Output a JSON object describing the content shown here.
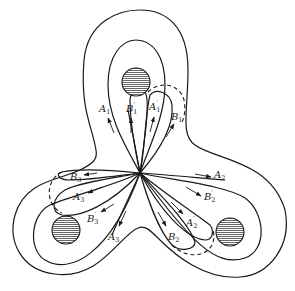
{
  "figure": {
    "colors": {
      "ink": "#1a1a1a",
      "hatch_fill": "#9a9a9a",
      "background": "#ffffff"
    },
    "center": [
      140,
      173
    ],
    "obstacles": [
      {
        "name": "top",
        "cx": 136,
        "cy": 82,
        "r": 14
      },
      {
        "name": "left",
        "cx": 66,
        "cy": 230,
        "r": 14
      },
      {
        "name": "right",
        "cx": 230,
        "cy": 232,
        "r": 14
      }
    ],
    "labels": [
      {
        "id": "A1",
        "base": "A",
        "sub": "1",
        "prime": "",
        "x": 99,
        "y": 112
      },
      {
        "id": "B1p",
        "base": "B",
        "sub": "1",
        "prime": "′",
        "x": 126,
        "y": 112
      },
      {
        "id": "A1p",
        "base": "A",
        "sub": "1",
        "prime": "′",
        "x": 149,
        "y": 110
      },
      {
        "id": "B1",
        "base": "B",
        "sub": "1",
        "prime": "",
        "x": 171,
        "y": 120
      },
      {
        "id": "A2",
        "base": "A",
        "sub": "2",
        "prime": "",
        "x": 214,
        "y": 178
      },
      {
        "id": "B2p",
        "base": "B",
        "sub": "2",
        "prime": "′",
        "x": 204,
        "y": 200
      },
      {
        "id": "A2p",
        "base": "A",
        "sub": "2",
        "prime": "′",
        "x": 186,
        "y": 226
      },
      {
        "id": "B2",
        "base": "B",
        "sub": "2",
        "prime": "",
        "x": 168,
        "y": 240
      },
      {
        "id": "B3",
        "base": "B",
        "sub": "3",
        "prime": "",
        "x": 70,
        "y": 180
      },
      {
        "id": "A3p",
        "base": "A",
        "sub": "3",
        "prime": "′",
        "x": 73,
        "y": 200
      },
      {
        "id": "B3p",
        "base": "B",
        "sub": "3",
        "prime": "′",
        "x": 87,
        "y": 222
      },
      {
        "id": "A3",
        "base": "A",
        "sub": "3",
        "prime": "",
        "x": 108,
        "y": 240
      }
    ]
  }
}
